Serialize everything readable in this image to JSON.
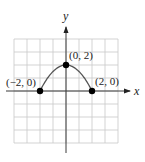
{
  "chart_data": {
    "type": "line",
    "title": "",
    "xlabel": "x",
    "ylabel": "y",
    "xlim": [
      -4,
      4
    ],
    "ylim": [
      -4,
      4
    ],
    "grid": true,
    "grid_step": 1,
    "series": [
      {
        "name": "y = 2 - x^2/2",
        "function": "2 - x^2/2",
        "domain": [
          -2,
          2
        ],
        "x": [
          -2,
          -1.5,
          -1,
          -0.5,
          0,
          0.5,
          1,
          1.5,
          2
        ],
        "y": [
          0,
          0.875,
          1.5,
          1.875,
          2,
          1.875,
          1.5,
          0.875,
          0
        ]
      }
    ],
    "points": [
      {
        "x": -2,
        "y": 0,
        "label": "(−2, 0)",
        "label_position": "above-left"
      },
      {
        "x": 0,
        "y": 2,
        "label": "(0, 2)",
        "label_position": "above-right"
      },
      {
        "x": 2,
        "y": 0,
        "label": "(2, 0)",
        "label_position": "above-right"
      }
    ]
  }
}
